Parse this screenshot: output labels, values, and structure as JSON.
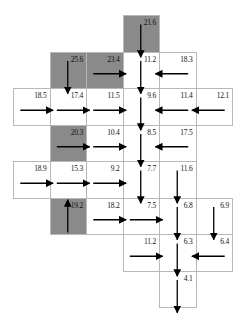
{
  "diagram": {
    "type": "flow-direction-grid",
    "cell_size": 36.5,
    "origin": {
      "x": 13,
      "y": 15
    },
    "colors": {
      "gray_cell": "#8a8a8a",
      "white_cell": "#ffffff",
      "border": "#b8b8b8",
      "arrow": "#000000"
    },
    "cells": [
      {
        "row": 0,
        "col": 3,
        "value": "21.6",
        "gray": true,
        "flow": "down"
      },
      {
        "row": 1,
        "col": 1,
        "value": "25.6",
        "gray": true,
        "flow": "down"
      },
      {
        "row": 1,
        "col": 2,
        "value": "23.4",
        "gray": true,
        "flow": "right"
      },
      {
        "row": 1,
        "col": 3,
        "value": "11.2",
        "gray": false,
        "flow": "down"
      },
      {
        "row": 1,
        "col": 4,
        "value": "18.3",
        "gray": false,
        "flow": "left"
      },
      {
        "row": 2,
        "col": 0,
        "value": "18.5",
        "gray": false,
        "flow": "right"
      },
      {
        "row": 2,
        "col": 1,
        "value": "17.4",
        "gray": false,
        "flow": "right"
      },
      {
        "row": 2,
        "col": 2,
        "value": "11.5",
        "gray": false,
        "flow": "right"
      },
      {
        "row": 2,
        "col": 3,
        "value": "9.6",
        "gray": false,
        "flow": "down"
      },
      {
        "row": 2,
        "col": 4,
        "value": "11.4",
        "gray": false,
        "flow": "left"
      },
      {
        "row": 2,
        "col": 5,
        "value": "12.1",
        "gray": false,
        "flow": "left"
      },
      {
        "row": 3,
        "col": 1,
        "value": "20.3",
        "gray": true,
        "flow": "right"
      },
      {
        "row": 3,
        "col": 2,
        "value": "10.4",
        "gray": false,
        "flow": "right"
      },
      {
        "row": 3,
        "col": 3,
        "value": "8.5",
        "gray": false,
        "flow": "down"
      },
      {
        "row": 3,
        "col": 4,
        "value": "17.5",
        "gray": false,
        "flow": "left"
      },
      {
        "row": 4,
        "col": 0,
        "value": "18.9",
        "gray": false,
        "flow": "right"
      },
      {
        "row": 4,
        "col": 1,
        "value": "15.3",
        "gray": false,
        "flow": "right"
      },
      {
        "row": 4,
        "col": 2,
        "value": "9.2",
        "gray": false,
        "flow": "right"
      },
      {
        "row": 4,
        "col": 3,
        "value": "7.7",
        "gray": false,
        "flow": "down"
      },
      {
        "row": 4,
        "col": 4,
        "value": "11.6",
        "gray": false,
        "flow": "down"
      },
      {
        "row": 5,
        "col": 1,
        "value": "19.2",
        "gray": true,
        "flow": "up"
      },
      {
        "row": 5,
        "col": 2,
        "value": "18.2",
        "gray": false,
        "flow": "right"
      },
      {
        "row": 5,
        "col": 3,
        "value": "7.5",
        "gray": false,
        "flow": "right"
      },
      {
        "row": 5,
        "col": 4,
        "value": "6.8",
        "gray": false,
        "flow": "down"
      },
      {
        "row": 5,
        "col": 5,
        "value": "6.9",
        "gray": false,
        "flow": "down"
      },
      {
        "row": 6,
        "col": 3,
        "value": "11.2",
        "gray": false,
        "flow": "right"
      },
      {
        "row": 6,
        "col": 4,
        "value": "6.3",
        "gray": false,
        "flow": "down"
      },
      {
        "row": 6,
        "col": 5,
        "value": "6.4",
        "gray": false,
        "flow": "left"
      },
      {
        "row": 7,
        "col": 4,
        "value": "4.1",
        "gray": false,
        "flow": "down"
      }
    ]
  }
}
